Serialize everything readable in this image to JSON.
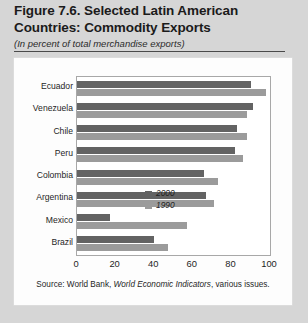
{
  "figure": {
    "title": "Figure 7.6. Selected Latin American Countries: Commodity Exports",
    "subtitle": "(In percent of total merchandise exports)",
    "source_prefix": "Source: World Bank, ",
    "source_italic": "World Economic Indicators",
    "source_suffix": ", various issues."
  },
  "colors": {
    "series_2000": "#636363",
    "series_1990": "#9b9b9b",
    "page_background": "#d6d6d6",
    "card_background": "#fdfdfd",
    "rule": "#4a4a4a"
  },
  "chart_data": {
    "type": "bar",
    "orientation": "horizontal",
    "title": "Figure 7.6. Selected Latin American Countries: Commodity Exports",
    "subtitle": "(In percent of total merchandise exports)",
    "xlabel": "",
    "ylabel": "",
    "xlim": [
      0,
      100
    ],
    "xticks": [
      0,
      20,
      40,
      60,
      80,
      100
    ],
    "xtick_labels": [
      "0",
      "20",
      "40",
      "60",
      "80",
      "100"
    ],
    "grid": false,
    "legend_position": "inside-lower-right",
    "categories": [
      "Ecuador",
      "Venezuela",
      "Chile",
      "Peru",
      "Colombia",
      "Argentina",
      "Mexico",
      "Brazil"
    ],
    "series": [
      {
        "name": "2000",
        "color": "#636363",
        "values": [
          90,
          91,
          83,
          82,
          66,
          67,
          17,
          40
        ]
      },
      {
        "name": "1990",
        "color": "#9b9b9b",
        "values": [
          98,
          88,
          88,
          86,
          73,
          71,
          57,
          47
        ]
      }
    ]
  }
}
